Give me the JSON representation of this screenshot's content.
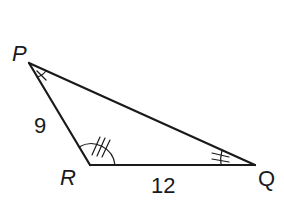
{
  "diagram": {
    "type": "triangle",
    "vertices": {
      "P": {
        "label": "P",
        "x": 29,
        "y": 63
      },
      "R": {
        "label": "R",
        "x": 90,
        "y": 165
      },
      "Q": {
        "label": "Q",
        "x": 255,
        "y": 165
      }
    },
    "sides": {
      "PR": {
        "label": "9"
      },
      "RQ": {
        "label": "12"
      },
      "PQ": {
        "label": ""
      }
    },
    "angle_marks": {
      "P": {
        "ticks": 1
      },
      "R": {
        "ticks": 3
      },
      "Q": {
        "ticks": 2
      }
    },
    "colors": {
      "stroke": "#1a1a1a",
      "background": "#ffffff"
    }
  }
}
